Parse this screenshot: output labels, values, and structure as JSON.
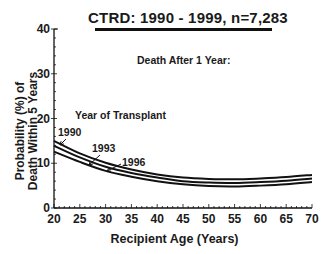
{
  "chart_data": {
    "type": "line",
    "title": "CTRD:  1990 - 1999, n=7,283",
    "subtitle": "Death After 1 Year:",
    "xlabel": "Recipient Age (Years)",
    "ylabel_line1": "Probability (%) of",
    "ylabel_line2": "Death Within 5 Years",
    "legend_title": "Year of Transplant",
    "xlim": [
      20,
      70
    ],
    "ylim": [
      0,
      40
    ],
    "x_ticks": [
      20,
      25,
      30,
      35,
      40,
      45,
      50,
      55,
      60,
      65,
      70
    ],
    "y_ticks": [
      0,
      10,
      20,
      30,
      40
    ],
    "grid": false,
    "x": [
      20,
      25,
      30,
      35,
      40,
      45,
      50,
      55,
      60,
      65,
      70
    ],
    "series": [
      {
        "name": "1990",
        "values": [
          15.0,
          12.2,
          10.1,
          8.6,
          7.5,
          6.8,
          6.5,
          6.4,
          6.6,
          6.9,
          7.4
        ]
      },
      {
        "name": "1993",
        "values": [
          13.9,
          11.3,
          9.2,
          7.8,
          6.8,
          6.0,
          5.7,
          5.6,
          5.8,
          6.1,
          6.6
        ]
      },
      {
        "name": "1996",
        "values": [
          12.6,
          10.3,
          8.3,
          7.0,
          6.0,
          5.3,
          4.9,
          4.8,
          5.0,
          5.3,
          5.8
        ]
      }
    ],
    "annotations": [
      {
        "label": "1990",
        "points_to_series": "1990"
      },
      {
        "label": "1993",
        "points_to_series": "1993"
      },
      {
        "label": "1996",
        "points_to_series": "1996"
      }
    ]
  },
  "colors": {
    "line": "#111111",
    "text": "#1a1a1a",
    "background": "#ffffff"
  }
}
